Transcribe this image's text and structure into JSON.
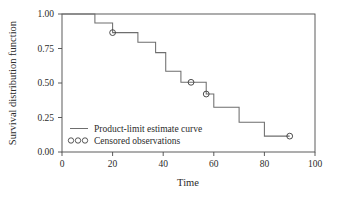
{
  "chart_data": {
    "type": "line",
    "subtype": "kaplan-meier-step",
    "title": "",
    "xlabel": "Time",
    "ylabel": "Survival distribution function",
    "xlim": [
      0,
      100
    ],
    "ylim": [
      0.0,
      1.0
    ],
    "grid": false,
    "xticks": [
      0,
      20,
      40,
      60,
      80,
      100
    ],
    "xtick_labels": [
      "0",
      "20",
      "40",
      "60",
      "80",
      "100"
    ],
    "yticks": [
      0.0,
      0.25,
      0.5,
      0.75,
      1.0
    ],
    "ytick_labels": [
      "0.00",
      "0.25",
      "0.50",
      "0.75",
      "1.00"
    ],
    "series": [
      {
        "name": "Product-limit estimate curve",
        "style": "step-post",
        "color": "#6e6e6e",
        "x": [
          0,
          13,
          13,
          20,
          20,
          30,
          30,
          37,
          37,
          41,
          41,
          47,
          47,
          51,
          51,
          57,
          57,
          60,
          60,
          70,
          70,
          80,
          80,
          90
        ],
        "y": [
          1.0,
          1.0,
          0.935,
          0.935,
          0.865,
          0.865,
          0.795,
          0.795,
          0.72,
          0.72,
          0.585,
          0.585,
          0.505,
          0.505,
          0.505,
          0.505,
          0.42,
          0.42,
          0.325,
          0.325,
          0.215,
          0.215,
          0.115,
          0.115
        ]
      }
    ],
    "censored": {
      "name": "Censored observations",
      "marker": "open-circle",
      "points": [
        {
          "x": 20,
          "y": 0.865
        },
        {
          "x": 51,
          "y": 0.505
        },
        {
          "x": 57,
          "y": 0.42
        },
        {
          "x": 90,
          "y": 0.115
        }
      ]
    },
    "legend": {
      "position": "inside-lower-left",
      "entries": [
        {
          "label": "Product-limit estimate curve",
          "glyph": "line"
        },
        {
          "label": "Censored observations",
          "glyph": "circles"
        }
      ]
    },
    "colors": {
      "curve": "#6e6e6e",
      "axis": "#4a4a4a",
      "text": "#2b2b2b",
      "background": "#ffffff"
    }
  }
}
